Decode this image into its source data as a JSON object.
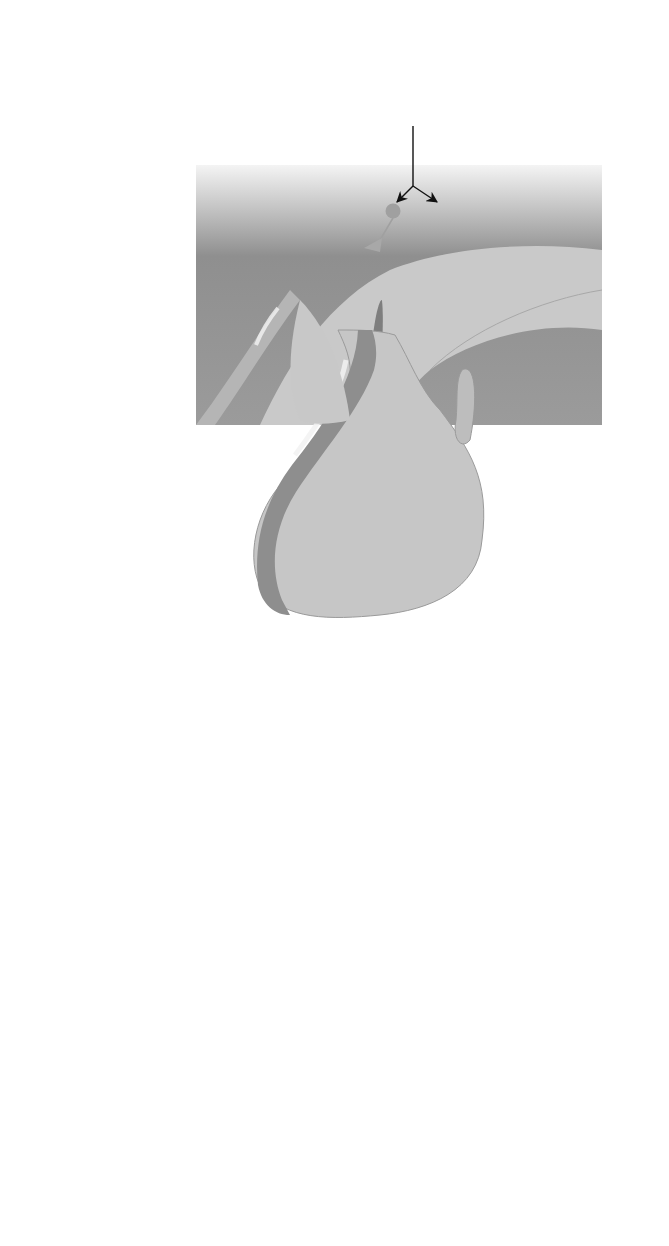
{
  "diagram": {
    "nodes": {
      "sound_cry": [
        "Sound of",
        "child’s cry"
      ],
      "higher_brain": [
        "Higher brain",
        "centers"
      ],
      "hypothalamus": [
        "Hypothalamus"
      ],
      "pih_cell": [
        "PIH cell"
      ],
      "oxytocin_neuron": [
        "Oxytocin neuron"
      ],
      "portal_system": [
        "Portal system"
      ],
      "pih_decrease": [
        "↓ PIH"
      ],
      "anterior_pituitary": [
        "Anterior",
        "pituitary"
      ],
      "posterior_pituitary": [
        "Posterior",
        "pituitary"
      ],
      "inhibition_removed": [
        "Inhibition of",
        "prolactin cells",
        "is removed"
      ],
      "prolactin_increase": [
        "↑ Prolactin"
      ],
      "oxytocin_increase": [
        "↑ Oxytocin"
      ],
      "ascending_sensory": [
        "Ascending sensory information"
      ],
      "milk_secretion": [
        "Milk",
        "secretion"
      ],
      "milk_ejected": [
        "Milk",
        "ejected"
      ],
      "smooth_muscle": [
        "Smooth muscle",
        "contraction"
      ],
      "baby_suckling": [
        "Baby",
        "suckling"
      ],
      "mechanoreceptors": [
        "Mechanoreceptors",
        "in nipple"
      ]
    },
    "signs": {
      "stimulatory": "+",
      "inhibitory": "−"
    },
    "edges": [
      {
        "from": "Sound of child’s cry",
        "to": "Higher brain centers"
      },
      {
        "from": "Higher brain centers",
        "to": "Oxytocin neuron input (+)"
      },
      {
        "from": "Higher brain centers",
        "to": "PIH cell input (−)"
      },
      {
        "from": "PIH cell",
        "to": "↓ PIH via portal system"
      },
      {
        "from": "↓ PIH",
        "to": "Anterior pituitary prolactin cells"
      },
      {
        "from": "Anterior pituitary",
        "to": "↑ Prolactin"
      },
      {
        "from": "Oxytocin neuron",
        "to": "Posterior pituitary"
      },
      {
        "from": "Posterior pituitary",
        "to": "↑ Oxytocin"
      },
      {
        "from": "↑ Prolactin",
        "to": "Milk secretion"
      },
      {
        "from": "↑ Oxytocin",
        "to": "Smooth muscle contraction"
      },
      {
        "from": "Smooth muscle contraction",
        "to": "Milk ejected"
      },
      {
        "from": "Baby suckling",
        "to": "Mechanoreceptors in nipple"
      },
      {
        "from": "Mechanoreceptors in nipple",
        "to": "Ascending sensory information"
      },
      {
        "from": "Ascending sensory information",
        "to": "Higher brain centers"
      }
    ],
    "colors": {
      "box_dark_edge": "#7a7a7a",
      "box_light_center": "#f2f2f2",
      "rounded_box_fill": "#d9d9d9",
      "brain_dark": "#8a8a8a",
      "pituitary": "#c8c8c8",
      "sensory_line": "#8c8c8c"
    }
  }
}
